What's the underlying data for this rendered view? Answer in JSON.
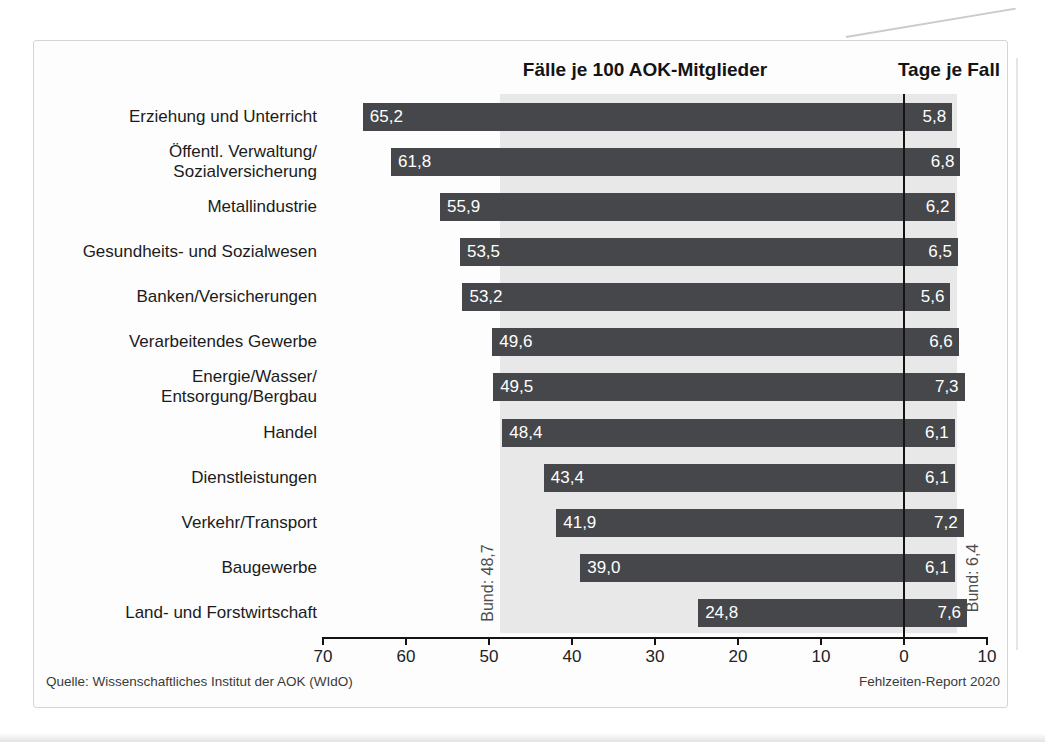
{
  "figure": {
    "footer_left": "Quelle: Wissenschaftliches Institut der AOK (WIdO)",
    "footer_right": "Fehlzeiten-Report 2020"
  },
  "chart_data": {
    "type": "bar",
    "orientation": "horizontal-diverging",
    "title_left_axis": "Fälle je 100 AOK-Mitglieder",
    "title_right_axis": "Tage je Fall",
    "categories": [
      "Erziehung und Unterricht",
      "Öffentl. Verwaltung/\nSozialversicherung",
      "Metallindustrie",
      "Gesundheits- und Sozialwesen",
      "Banken/Versicherungen",
      "Verarbeitendes Gewerbe",
      "Energie/Wasser/\nEntsorgung/Bergbau",
      "Handel",
      "Dienstleistungen",
      "Verkehr/Transport",
      "Baugewerbe",
      "Land- und Forstwirtschaft"
    ],
    "series": [
      {
        "name": "Fälle je 100 AOK-Mitglieder",
        "side": "left",
        "values": [
          65.2,
          61.8,
          55.9,
          53.5,
          53.2,
          49.6,
          49.5,
          48.4,
          43.4,
          41.9,
          39.0,
          24.8
        ],
        "value_labels": [
          "65,2",
          "61,8",
          "55,9",
          "53,5",
          "53,2",
          "49,6",
          "49,5",
          "48,4",
          "43,4",
          "41,9",
          "39,0",
          "24,8"
        ]
      },
      {
        "name": "Tage je Fall",
        "side": "right",
        "values": [
          5.8,
          6.8,
          6.2,
          6.5,
          5.6,
          6.6,
          7.3,
          6.1,
          6.1,
          7.2,
          6.1,
          7.6
        ],
        "value_labels": [
          "5,8",
          "6,8",
          "6,2",
          "6,5",
          "5,6",
          "6,6",
          "7,3",
          "6,1",
          "6,1",
          "7,2",
          "6,1",
          "7,6"
        ]
      }
    ],
    "reference": {
      "left": {
        "label": "Bund: 48,7",
        "value": 48.7
      },
      "right": {
        "label": "Bund: 6,4",
        "value": 6.4
      }
    },
    "axis": {
      "ticks": [
        {
          "label": "70",
          "value": 70,
          "side": "left"
        },
        {
          "label": "60",
          "value": 60,
          "side": "left"
        },
        {
          "label": "50",
          "value": 50,
          "side": "left"
        },
        {
          "label": "40",
          "value": 40,
          "side": "left"
        },
        {
          "label": "30",
          "value": 30,
          "side": "left"
        },
        {
          "label": "20",
          "value": 20,
          "side": "left"
        },
        {
          "label": "10",
          "value": 10,
          "side": "left"
        },
        {
          "label": "0",
          "value": 0,
          "side": "left"
        },
        {
          "label": "10",
          "value": 10,
          "side": "right"
        }
      ],
      "left_range": [
        70,
        0
      ],
      "right_range": [
        0,
        10
      ],
      "grid": false,
      "legend": "none"
    },
    "colors": {
      "bar": "#45474a",
      "band": "#e8e8e8",
      "axis": "#141414",
      "value_text": "#ffffff"
    }
  }
}
